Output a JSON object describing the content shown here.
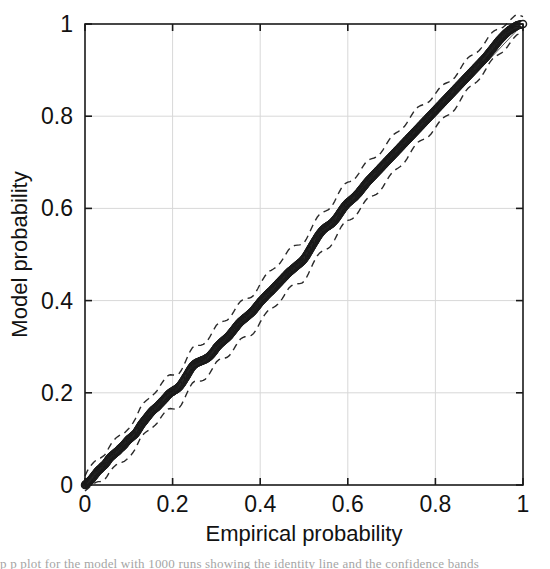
{
  "figure": {
    "background_color": "#ffffff",
    "ink_color": "#1a1a1a",
    "grid_color": "#d8d8d8",
    "caption_fragment": "p p  plot  for  the  model  with  1000 runs showing the  identity  line  and  the  confidence  bands"
  },
  "chart_data": {
    "type": "scatter",
    "title": "",
    "xlabel": "Empirical probability",
    "ylabel": "Model probability",
    "xlim": [
      0,
      1
    ],
    "ylim": [
      0,
      1
    ],
    "grid": true,
    "legend": "none",
    "xticks": [
      0,
      0.2,
      0.4,
      0.6,
      0.8,
      1
    ],
    "xticklabels": [
      "0",
      "0.2",
      "0.4",
      "0.6",
      "0.8",
      "1"
    ],
    "yticks": [
      0,
      0.2,
      0.4,
      0.6,
      0.8,
      1
    ],
    "yticklabels": [
      "0",
      "0.2",
      "0.4",
      "0.6",
      "0.8",
      "1"
    ],
    "marker": "circle-open",
    "marker_size": 7,
    "marker_edge_color": "#1a1a1a",
    "marker_face_color": "#ffffff",
    "band_style": "dashed",
    "band_color": "#2a2a2a",
    "series": [
      {
        "name": "Model vs empirical probability",
        "x": [
          0.0,
          0.005,
          0.01,
          0.015,
          0.02,
          0.025,
          0.03,
          0.035,
          0.04,
          0.045,
          0.05,
          0.055,
          0.06,
          0.065,
          0.07,
          0.075,
          0.08,
          0.085,
          0.09,
          0.095,
          0.1,
          0.105,
          0.11,
          0.115,
          0.12,
          0.125,
          0.13,
          0.135,
          0.14,
          0.145,
          0.15,
          0.155,
          0.16,
          0.165,
          0.17,
          0.175,
          0.18,
          0.185,
          0.19,
          0.195,
          0.2,
          0.205,
          0.21,
          0.215,
          0.22,
          0.225,
          0.23,
          0.235,
          0.24,
          0.245,
          0.25,
          0.255,
          0.26,
          0.265,
          0.27,
          0.275,
          0.28,
          0.285,
          0.29,
          0.295,
          0.3,
          0.305,
          0.31,
          0.315,
          0.32,
          0.325,
          0.33,
          0.335,
          0.34,
          0.345,
          0.35,
          0.355,
          0.36,
          0.365,
          0.37,
          0.375,
          0.38,
          0.385,
          0.39,
          0.395,
          0.4,
          0.405,
          0.41,
          0.415,
          0.42,
          0.425,
          0.43,
          0.435,
          0.44,
          0.445,
          0.45,
          0.455,
          0.46,
          0.465,
          0.47,
          0.475,
          0.48,
          0.485,
          0.49,
          0.495,
          0.5,
          0.505,
          0.51,
          0.515,
          0.52,
          0.525,
          0.53,
          0.535,
          0.54,
          0.545,
          0.55,
          0.555,
          0.56,
          0.565,
          0.57,
          0.575,
          0.58,
          0.585,
          0.59,
          0.595,
          0.6,
          0.605,
          0.61,
          0.615,
          0.62,
          0.625,
          0.63,
          0.635,
          0.64,
          0.645,
          0.65,
          0.655,
          0.66,
          0.665,
          0.67,
          0.675,
          0.68,
          0.685,
          0.69,
          0.695,
          0.7,
          0.705,
          0.71,
          0.715,
          0.72,
          0.725,
          0.73,
          0.735,
          0.74,
          0.745,
          0.75,
          0.755,
          0.76,
          0.765,
          0.77,
          0.775,
          0.78,
          0.785,
          0.79,
          0.795,
          0.8,
          0.805,
          0.81,
          0.815,
          0.82,
          0.825,
          0.83,
          0.835,
          0.84,
          0.845,
          0.85,
          0.855,
          0.86,
          0.865,
          0.87,
          0.875,
          0.88,
          0.885,
          0.89,
          0.895,
          0.9,
          0.905,
          0.91,
          0.915,
          0.92,
          0.925,
          0.93,
          0.935,
          0.94,
          0.945,
          0.95,
          0.955,
          0.96,
          0.965,
          0.97,
          0.975,
          0.98,
          0.985,
          0.99,
          1.0
        ],
        "y": [
          0.0,
          0.004,
          0.008,
          0.013,
          0.019,
          0.025,
          0.031,
          0.035,
          0.04,
          0.044,
          0.05,
          0.057,
          0.062,
          0.066,
          0.07,
          0.074,
          0.079,
          0.083,
          0.088,
          0.094,
          0.099,
          0.103,
          0.107,
          0.111,
          0.118,
          0.126,
          0.133,
          0.139,
          0.145,
          0.151,
          0.157,
          0.162,
          0.166,
          0.17,
          0.175,
          0.18,
          0.185,
          0.19,
          0.196,
          0.2,
          0.203,
          0.206,
          0.209,
          0.213,
          0.219,
          0.226,
          0.234,
          0.242,
          0.25,
          0.257,
          0.262,
          0.265,
          0.267,
          0.269,
          0.271,
          0.273,
          0.276,
          0.28,
          0.285,
          0.291,
          0.298,
          0.303,
          0.308,
          0.312,
          0.316,
          0.32,
          0.325,
          0.331,
          0.337,
          0.343,
          0.349,
          0.354,
          0.358,
          0.362,
          0.366,
          0.37,
          0.374,
          0.379,
          0.385,
          0.391,
          0.397,
          0.402,
          0.407,
          0.412,
          0.417,
          0.421,
          0.426,
          0.431,
          0.436,
          0.441,
          0.446,
          0.451,
          0.456,
          0.461,
          0.465,
          0.469,
          0.473,
          0.477,
          0.481,
          0.485,
          0.49,
          0.497,
          0.505,
          0.513,
          0.521,
          0.529,
          0.537,
          0.544,
          0.55,
          0.555,
          0.559,
          0.562,
          0.565,
          0.569,
          0.574,
          0.58,
          0.587,
          0.594,
          0.601,
          0.607,
          0.612,
          0.616,
          0.62,
          0.624,
          0.629,
          0.634,
          0.64,
          0.646,
          0.652,
          0.658,
          0.663,
          0.668,
          0.673,
          0.678,
          0.683,
          0.688,
          0.693,
          0.698,
          0.703,
          0.708,
          0.713,
          0.718,
          0.723,
          0.728,
          0.733,
          0.738,
          0.743,
          0.748,
          0.753,
          0.758,
          0.763,
          0.768,
          0.773,
          0.778,
          0.783,
          0.788,
          0.793,
          0.798,
          0.803,
          0.808,
          0.813,
          0.818,
          0.823,
          0.828,
          0.833,
          0.838,
          0.843,
          0.848,
          0.853,
          0.858,
          0.863,
          0.868,
          0.873,
          0.878,
          0.883,
          0.888,
          0.893,
          0.898,
          0.903,
          0.908,
          0.913,
          0.918,
          0.923,
          0.928,
          0.934,
          0.94,
          0.946,
          0.952,
          0.958,
          0.964,
          0.969,
          0.974,
          0.979,
          0.983,
          0.987,
          0.99,
          0.993,
          0.996,
          0.998,
          1.0
        ]
      }
    ],
    "confidence_bands": {
      "upper_offset": 0.035,
      "lower_offset": 0.035,
      "description": "dashed upper and lower confidence envelope around the data"
    }
  }
}
